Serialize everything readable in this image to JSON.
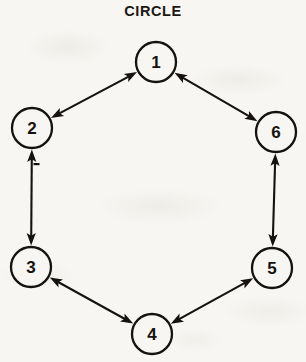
{
  "figure": {
    "title": "CIRCLE",
    "type": "network-topology-diagram",
    "background_color": "#f7f6f2",
    "stroke_color": "#15120f"
  },
  "chart_data": {
    "type": "diagram",
    "title": "CIRCLE",
    "xlabel": "",
    "ylabel": "",
    "layout": "hexagonal-ring",
    "node_radius": 20,
    "nodes": [
      {
        "id": "n1",
        "label": "1",
        "x": 156,
        "y": 62
      },
      {
        "id": "n2",
        "label": "2",
        "x": 32,
        "y": 128
      },
      {
        "id": "n3",
        "label": "3",
        "x": 31,
        "y": 267
      },
      {
        "id": "n4",
        "label": "4",
        "x": 152,
        "y": 334
      },
      {
        "id": "n5",
        "label": "5",
        "x": 272,
        "y": 268
      },
      {
        "id": "n6",
        "label": "6",
        "x": 276,
        "y": 132
      }
    ],
    "edges": [
      {
        "from": "n1",
        "to": "n2",
        "direction": "bidirectional"
      },
      {
        "from": "n2",
        "to": "n3",
        "direction": "bidirectional"
      },
      {
        "from": "n3",
        "to": "n4",
        "direction": "bidirectional"
      },
      {
        "from": "n4",
        "to": "n5",
        "direction": "bidirectional"
      },
      {
        "from": "n5",
        "to": "n6",
        "direction": "bidirectional"
      },
      {
        "from": "n6",
        "to": "n1",
        "direction": "bidirectional"
      }
    ],
    "node_count": 6,
    "edge_count": 6,
    "annotations": []
  }
}
